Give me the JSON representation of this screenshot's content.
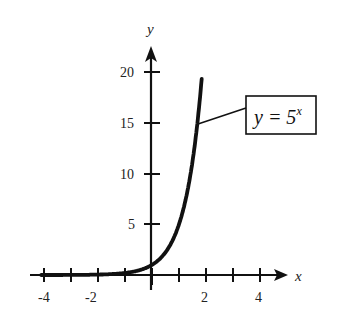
{
  "chart_data": {
    "type": "line",
    "title": "",
    "xlabel": "x",
    "ylabel": "y",
    "xlim": [
      -4.2,
      5.2
    ],
    "ylim": [
      0,
      20.5
    ],
    "grid": false,
    "x_ticks": [
      -4,
      -3,
      -2,
      -1,
      0,
      1,
      2,
      3,
      4
    ],
    "x_tick_labels": [
      "-4",
      "-2",
      "2",
      "4"
    ],
    "x_tick_label_values": [
      -4,
      -2,
      2,
      4
    ],
    "y_ticks": [
      5,
      10,
      15,
      20
    ],
    "y_tick_labels": [
      "5",
      "10",
      "15",
      "20"
    ],
    "series": [
      {
        "name": "y = 5^x",
        "function": "5^x",
        "x": [
          -4,
          -3,
          -2,
          -1,
          0,
          0.5,
          1,
          1.25,
          1.5,
          1.75,
          1.86
        ],
        "values": [
          0.0016,
          0.008,
          0.04,
          0.2,
          1,
          2.24,
          5,
          7.48,
          11.18,
          16.72,
          20
        ]
      }
    ],
    "annotations": [
      {
        "text_main": "y = 5",
        "text_sup": "x",
        "points_to": [
          1.7,
          15
        ]
      }
    ]
  },
  "labels": {
    "x_axis": "x",
    "y_axis": "y",
    "equation_main": "y = 5",
    "equation_sup": "x",
    "xt_m4": "-4",
    "xt_m2": "-2",
    "xt_2": "2",
    "xt_4": "4",
    "yt_5": "5",
    "yt_10": "10",
    "yt_15": "15",
    "yt_20": "20"
  }
}
